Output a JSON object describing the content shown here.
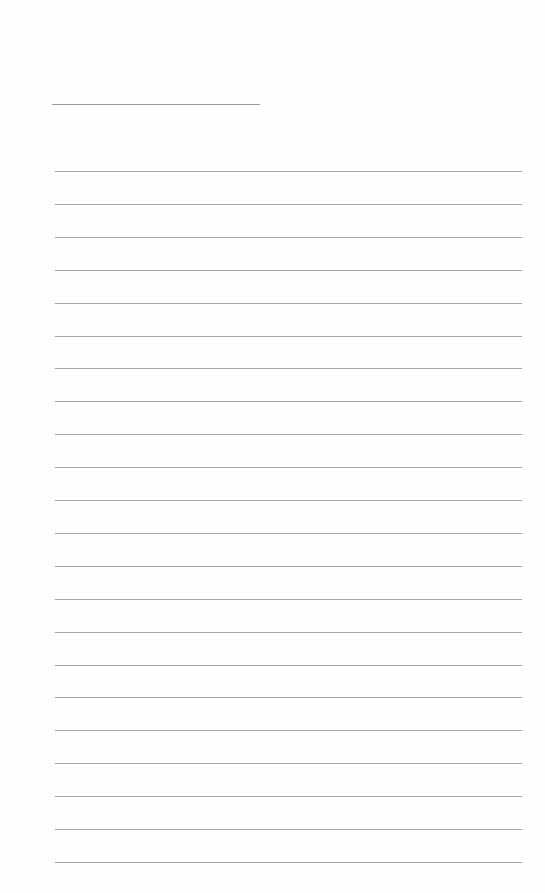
{
  "document": {
    "type": "blank-lined-page",
    "title_line": {
      "left": 52,
      "top": 104,
      "width": 208
    },
    "ruled_lines": {
      "count": 22,
      "first_top": 171,
      "spacing": 32.9,
      "left": 55,
      "width": 467
    },
    "colors": {
      "background": "#fefefe",
      "line": "#a6a6a6",
      "title_line": "#9a9a9a"
    }
  }
}
